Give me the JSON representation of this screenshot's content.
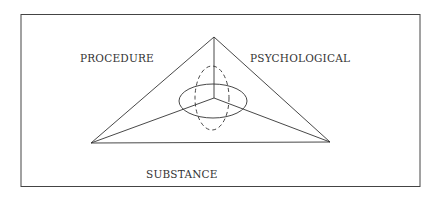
{
  "diagram": {
    "labels": {
      "procedure": "PROCEDURE",
      "psychological": "PSYCHOLOGICAL",
      "substance": "SUBSTANCE"
    },
    "colors": {
      "line": "#333333",
      "background": "#ffffff"
    }
  }
}
